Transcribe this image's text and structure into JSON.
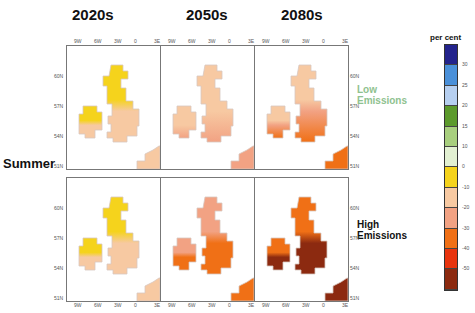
{
  "decades": [
    "2020s",
    "2050s",
    "2080s"
  ],
  "season": "Summer",
  "scenarios": [
    {
      "label_line1": "Low",
      "label_line2": "Emissions",
      "color": "#8fc28f"
    },
    {
      "label_line1": "High",
      "label_line2": "Emissions",
      "color": "#111111"
    }
  ],
  "axes": {
    "lon_ticks": [
      "9W",
      "6W",
      "3W",
      "0",
      "3E"
    ],
    "lat_ticks": [
      "60N",
      "57N",
      "54N",
      "51N"
    ]
  },
  "legend": {
    "title": "per cent",
    "colors": [
      "#23238c",
      "#4a90d9",
      "#b6cff0",
      "#5c9a2c",
      "#a8cf7e",
      "#e2f0d2",
      "#f5d31c",
      "#f7c9a2",
      "#f2a283",
      "#f07016",
      "#e8340e",
      "#8c2a10"
    ],
    "labels": [
      "30",
      "25",
      "20",
      "15",
      "10",
      "0",
      "-10",
      "-20",
      "-30",
      "-40",
      "-50"
    ]
  },
  "panels": [
    {
      "id": "low-2020s",
      "north": "#f5d31c",
      "south": "#f7c9a2",
      "hot": "#f7c9a2"
    },
    {
      "id": "low-2050s",
      "north": "#f7c9a2",
      "south": "#f7c9a2",
      "hot": "#f2a283"
    },
    {
      "id": "low-2080s",
      "north": "#f7c9a2",
      "south": "#f2a283",
      "hot": "#f07016"
    },
    {
      "id": "high-2020s",
      "north": "#f5d31c",
      "south": "#f7c9a2",
      "hot": "#f7c9a2"
    },
    {
      "id": "high-2050s",
      "north": "#f2a283",
      "south": "#f07016",
      "hot": "#f07016"
    },
    {
      "id": "high-2080s",
      "north": "#f07016",
      "south": "#8c2a10",
      "hot": "#8c2a10"
    }
  ]
}
